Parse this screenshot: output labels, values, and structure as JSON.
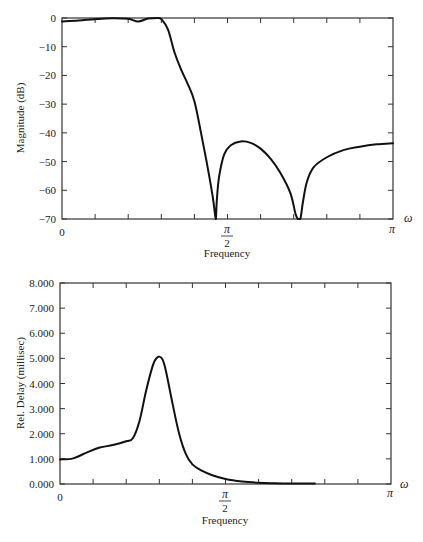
{
  "chart_data": [
    {
      "type": "line",
      "title": "",
      "xlabel": "Frequency",
      "ylabel": "Magnitude (dB)",
      "x_axis_symbol": "ω",
      "x_units": "radians (fraction of π)",
      "xlim": [
        0,
        1
      ],
      "ylim": [
        -70,
        0
      ],
      "grid": false,
      "y_ticks": [
        0,
        -10,
        -20,
        -30,
        -40,
        -50,
        -60,
        -70
      ],
      "y_tick_labels": [
        "0",
        "−10",
        "−20",
        "−30",
        "−40",
        "−50",
        "−60",
        "−70"
      ],
      "x_tick_labels": [
        {
          "value": 0,
          "label": "0"
        },
        {
          "value": 0.5,
          "label": "π/2",
          "numerator": "π",
          "denominator": "2"
        },
        {
          "value": 1,
          "label": "π"
        }
      ],
      "x_minor_ticks": [
        0.1,
        0.2,
        0.3,
        0.4,
        0.5,
        0.6,
        0.7,
        0.8,
        0.9
      ],
      "series": [
        {
          "name": "magnitude",
          "x": [
            0,
            0.05,
            0.1,
            0.15,
            0.2,
            0.23,
            0.26,
            0.29,
            0.3,
            0.32,
            0.34,
            0.36,
            0.38,
            0.4,
            0.42,
            0.44,
            0.455,
            0.463,
            0.465,
            0.468,
            0.475,
            0.49,
            0.51,
            0.54,
            0.57,
            0.6,
            0.63,
            0.66,
            0.69,
            0.705,
            0.712,
            0.72,
            0.728,
            0.74,
            0.76,
            0.8,
            0.85,
            0.9,
            0.95,
            1.0
          ],
          "values": [
            -1.2,
            -0.9,
            -0.4,
            -0.1,
            -0.3,
            -1.2,
            -0.2,
            0,
            -0.4,
            -4,
            -12,
            -18,
            -23,
            -29,
            -40,
            -52,
            -62,
            -69,
            -70,
            -63,
            -55,
            -47.5,
            -44.3,
            -43,
            -43.5,
            -45.5,
            -49,
            -54,
            -61,
            -68,
            -70,
            -70,
            -64,
            -57,
            -52,
            -48.5,
            -46,
            -44.8,
            -44,
            -43.6
          ]
        }
      ]
    },
    {
      "type": "line",
      "title": "",
      "xlabel": "Frequency",
      "ylabel": "Rel. Delay (millisec)",
      "x_axis_symbol": "ω",
      "x_units": "radians (fraction of π)",
      "xlim": [
        0,
        1
      ],
      "ylim": [
        0,
        8
      ],
      "grid": false,
      "y_ticks": [
        0,
        1,
        2,
        3,
        4,
        5,
        6,
        7,
        8
      ],
      "y_tick_labels": [
        "0.000",
        "1.000",
        "2.000",
        "3.000",
        "4.000",
        "5.000",
        "6.000",
        "7.000",
        "8.000"
      ],
      "x_tick_labels": [
        {
          "value": 0,
          "label": "0"
        },
        {
          "value": 0.5,
          "label": "π/2",
          "numerator": "π",
          "denominator": "2"
        },
        {
          "value": 1,
          "label": "π"
        }
      ],
      "x_minor_ticks": [
        0.1,
        0.2,
        0.3,
        0.4,
        0.5,
        0.6,
        0.7,
        0.8,
        0.9
      ],
      "series": [
        {
          "name": "relative delay",
          "x": [
            0,
            0.04,
            0.08,
            0.12,
            0.16,
            0.2,
            0.22,
            0.24,
            0.26,
            0.28,
            0.29,
            0.3,
            0.31,
            0.32,
            0.34,
            0.36,
            0.38,
            0.4,
            0.43,
            0.46,
            0.5,
            0.55,
            0.6,
            0.65,
            0.7,
            0.77
          ],
          "values": [
            0.98,
            1.02,
            1.25,
            1.45,
            1.55,
            1.7,
            1.82,
            2.5,
            3.7,
            4.7,
            4.98,
            5.07,
            4.95,
            4.5,
            3.2,
            2.0,
            1.2,
            0.78,
            0.52,
            0.35,
            0.2,
            0.1,
            0.05,
            0.03,
            0.02,
            0.02
          ]
        }
      ]
    }
  ]
}
